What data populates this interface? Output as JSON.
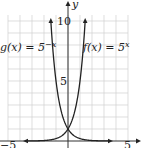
{
  "chart_data": {
    "type": "line",
    "title": "",
    "xlabel": "",
    "ylabel": "y",
    "xlim": [
      -5.5,
      6
    ],
    "ylim": [
      -0.6,
      11.5
    ],
    "grid": true,
    "x_ticks": [
      -5,
      5
    ],
    "y_ticks": [
      5,
      10
    ],
    "x_tick_labels": [
      "−5",
      "5"
    ],
    "y_tick_labels": [
      "5",
      "10"
    ],
    "series": [
      {
        "name": "g(x) = 5^(−x)",
        "label_main": "g(x) = 5",
        "label_exp": "−x",
        "formula": "5^-x",
        "x": [
          -1.43,
          -1,
          -0.5,
          0,
          0.5,
          1,
          2
        ],
        "y": [
          10,
          5,
          2.24,
          1,
          0.45,
          0.2,
          0.04
        ]
      },
      {
        "name": "f(x) = 5^x",
        "label_main": "f(x) = 5",
        "label_exp": "x",
        "formula": "5^x",
        "x": [
          -2,
          -1,
          -0.5,
          0,
          0.5,
          1,
          1.43
        ],
        "y": [
          0.04,
          0.2,
          0.45,
          1,
          2.24,
          5,
          10
        ]
      }
    ],
    "legend": "inline labels near curves"
  }
}
